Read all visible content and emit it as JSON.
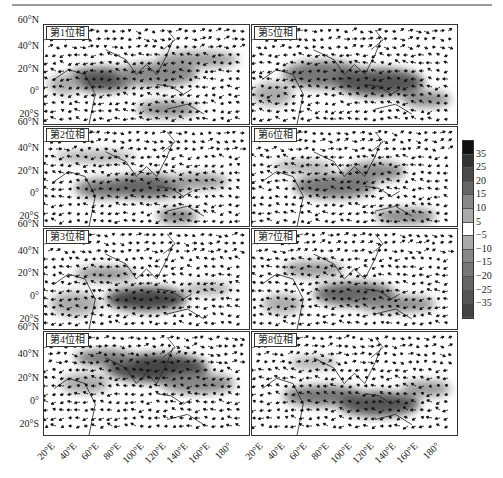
{
  "figure": {
    "type": "composite-map-panels",
    "panels": [
      {
        "label": "第1位相",
        "phase": 1
      },
      {
        "label": "第2位相",
        "phase": 2
      },
      {
        "label": "第3位相",
        "phase": 3
      },
      {
        "label": "第4位相",
        "phase": 4
      },
      {
        "label": "第5位相",
        "phase": 5
      },
      {
        "label": "第6位相",
        "phase": 6
      },
      {
        "label": "第7位相",
        "phase": 7
      },
      {
        "label": "第8位相",
        "phase": 8
      }
    ],
    "y_ticks": [
      "60°N",
      "40°N",
      "20°N",
      "0°",
      "20°S"
    ],
    "x_ticks": [
      "20°E",
      "40°E",
      "60°E",
      "80°E",
      "100°E",
      "120°E",
      "140°E",
      "160°E",
      "180°"
    ],
    "colorbar": {
      "labels": [
        "35",
        "25",
        "20",
        "15",
        "10",
        "5",
        "−5",
        "−10",
        "−15",
        "−20",
        "−25",
        "−35"
      ],
      "colors": [
        "#111111",
        "#333333",
        "#4a4a4a",
        "#666666",
        "#888888",
        "#aaaaaa",
        "#ffffff",
        "#aaaaaa",
        "#888888",
        "#777777",
        "#666666",
        "#555555",
        "#444444"
      ]
    }
  },
  "chart_data": {
    "type": "heatmap",
    "title": "",
    "xlabel": "Longitude",
    "ylabel": "Latitude",
    "xlim": [
      "20°E",
      "180°"
    ],
    "ylim": [
      "30°S",
      "60°N"
    ],
    "panels": [
      "第1位相",
      "第2位相",
      "第3位相",
      "第4位相",
      "第5位相",
      "第6位相",
      "第7位相",
      "第8位相"
    ],
    "colorbar_levels": [
      -35,
      -25,
      -20,
      -15,
      -10,
      -5,
      5,
      10,
      15,
      20,
      25,
      35
    ],
    "grid": false,
    "legend_position": "right colorbar"
  }
}
